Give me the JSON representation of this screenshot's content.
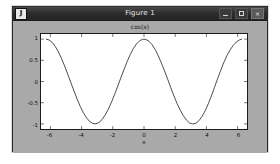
{
  "window": {
    "title": "Figure 1",
    "app_icon_glyph": "J",
    "controls": {
      "minimize_label": "–",
      "maximize_label": "□",
      "close_label": "×"
    }
  },
  "colors": {
    "titlebar": "#2e2e2e",
    "figure_background": "#a9a9a9",
    "axes_background": "#ffffff",
    "axes_border": "#1a1a1a",
    "curve": "#1f1f1f",
    "desktop": "#ffffff"
  },
  "chart_data": {
    "type": "line",
    "title": "cos(x)",
    "xlabel": "x",
    "ylabel": "",
    "xlim": [
      -6.6,
      6.6
    ],
    "ylim": [
      -1.12,
      1.12
    ],
    "grid": false,
    "legend": null,
    "xticks": [
      -6,
      -4,
      -2,
      0,
      2,
      4,
      6
    ],
    "xticklabels": [
      "-6",
      "-4",
      "-2",
      "0",
      "2",
      "4",
      "6"
    ],
    "yticks": [
      -1,
      -0.5,
      0,
      0.5,
      1
    ],
    "yticklabels": [
      "-1",
      "-0.5",
      "0",
      "0.5",
      "1"
    ],
    "series": [
      {
        "name": "cos(x)",
        "color": "#1f1f1f",
        "linewidth": 0.8,
        "x": [
          -6.2832,
          -6.0832,
          -5.8832,
          -5.6832,
          -5.4832,
          -5.2832,
          -5.0832,
          -4.8832,
          -4.6832,
          -4.4832,
          -4.2832,
          -4.0832,
          -3.8832,
          -3.6832,
          -3.4832,
          -3.2832,
          -3.0832,
          -2.8832,
          -2.6832,
          -2.4832,
          -2.2832,
          -2.0832,
          -1.8832,
          -1.6832,
          -1.4832,
          -1.2832,
          -1.0832,
          -0.8832,
          -0.6832,
          -0.4832,
          -0.2832,
          -0.0832,
          0.1168,
          0.3168,
          0.5168,
          0.7168,
          0.9168,
          1.1168,
          1.3168,
          1.5168,
          1.7168,
          1.9168,
          2.1168,
          2.3168,
          2.5168,
          2.7168,
          2.9168,
          3.1168,
          3.3168,
          3.5168,
          3.7168,
          3.9168,
          4.1168,
          4.3168,
          4.5168,
          4.7168,
          4.9168,
          5.1168,
          5.3168,
          5.5168,
          5.7168,
          5.9168,
          6.1168,
          6.2832
        ],
        "y": [
          1.0,
          0.9801,
          0.9211,
          0.8253,
          0.6967,
          0.5403,
          0.3624,
          0.17,
          -0.0292,
          -0.2272,
          -0.4161,
          -0.5885,
          -0.7374,
          -0.8569,
          -0.9422,
          -0.9898,
          -0.9977,
          -0.9657,
          -0.895,
          -0.7885,
          -0.6506,
          -0.4869,
          -0.3042,
          -0.1096,
          0.088,
          0.2819,
          0.4666,
          0.6346,
          0.7756,
          0.8854,
          0.9602,
          0.9965,
          0.9932,
          0.9503,
          0.8697,
          0.7538,
          0.6061,
          0.4348,
          0.2504,
          0.054,
          -0.1455,
          -0.3389,
          -0.5172,
          -0.6724,
          -0.8053,
          -0.9093,
          -0.9772,
          -0.9998,
          -0.9862,
          -0.9256,
          -0.8268,
          -0.6927,
          -0.5286,
          -0.3417,
          -0.14,
          0.0676,
          0.262,
          0.4499,
          0.613,
          0.7446,
          0.8515,
          0.9306,
          0.9814,
          1.0
        ]
      }
    ]
  }
}
